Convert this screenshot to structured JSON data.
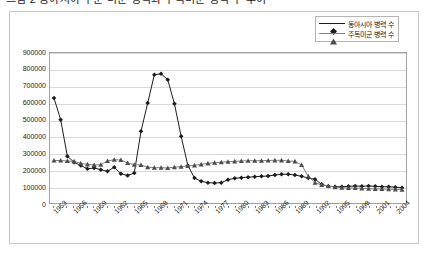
{
  "title": "그림 2  동아시아 주둔 미군 병력과 주독미군 병력 수 추이",
  "legend": {
    "position": "top-right",
    "entries": [
      {
        "label": "동아시아 병력 수",
        "marker": "diamond-marker-icon",
        "color": "#1a1a1a"
      },
      {
        "label": "주독미군 병력 수",
        "marker": "triangle-marker-icon",
        "color": "#808080"
      }
    ]
  },
  "axis": {
    "y_ticks": [
      "900000",
      "800000",
      "700000",
      "600000",
      "500000",
      "400000",
      "300000",
      "200000",
      "100000",
      "0"
    ],
    "x_ticks": [
      "1953",
      "1956",
      "1959",
      "1962",
      "1965",
      "1968",
      "1971",
      "1974",
      "1977",
      "1980",
      "1983",
      "1986",
      "1989",
      "1992",
      "1995",
      "1998",
      "2001",
      "2004"
    ]
  },
  "chart_data": {
    "type": "line",
    "title": "그림 2  동아시아 주둔 미군 병력과 주독미군 병력 수 추이",
    "xlabel": "",
    "ylabel": "",
    "ylim": [
      0,
      900000
    ],
    "xlim": [
      1953,
      2005
    ],
    "grid": true,
    "legend_position": "top-right",
    "x": [
      1953,
      1954,
      1955,
      1956,
      1957,
      1958,
      1959,
      1960,
      1961,
      1962,
      1963,
      1964,
      1965,
      1966,
      1967,
      1968,
      1969,
      1970,
      1971,
      1972,
      1973,
      1974,
      1975,
      1976,
      1977,
      1978,
      1979,
      1980,
      1981,
      1982,
      1983,
      1984,
      1985,
      1986,
      1987,
      1988,
      1989,
      1990,
      1991,
      1992,
      1993,
      1994,
      1995,
      1996,
      1997,
      1998,
      1999,
      2000,
      2001,
      2002,
      2003,
      2004,
      2005
    ],
    "series": [
      {
        "name": "동아시아 병력 수",
        "color": "#1a1a1a",
        "marker": "diamond",
        "values": [
          630000,
          500000,
          280000,
          245000,
          225000,
          205000,
          210000,
          200000,
          190000,
          215000,
          175000,
          165000,
          180000,
          430000,
          600000,
          770000,
          775000,
          740000,
          595000,
          400000,
          225000,
          150000,
          130000,
          122000,
          120000,
          122000,
          140000,
          148000,
          152000,
          155000,
          158000,
          160000,
          162000,
          168000,
          172000,
          173000,
          168000,
          160000,
          150000,
          142000,
          112000,
          100000,
          98000,
          97000,
          100000,
          102000,
          100000,
          102000,
          100000,
          98000,
          97000,
          95000,
          92000
        ]
      },
      {
        "name": "주독미군 병력 수",
        "color": "#808080",
        "marker": "triangle",
        "values": [
          255000,
          255000,
          252000,
          250000,
          238000,
          232000,
          228000,
          230000,
          252000,
          260000,
          258000,
          240000,
          230000,
          228000,
          215000,
          212000,
          212000,
          210000,
          215000,
          218000,
          222000,
          226000,
          232000,
          238000,
          242000,
          245000,
          248000,
          250000,
          252000,
          254000,
          254000,
          254000,
          255000,
          256000,
          256000,
          252000,
          250000,
          228000,
          160000,
          122000,
          108000,
          102000,
          95000,
          92000,
          90000,
          90000,
          88000,
          86000,
          85000,
          84000,
          83000,
          82000,
          80000
        ]
      }
    ]
  }
}
